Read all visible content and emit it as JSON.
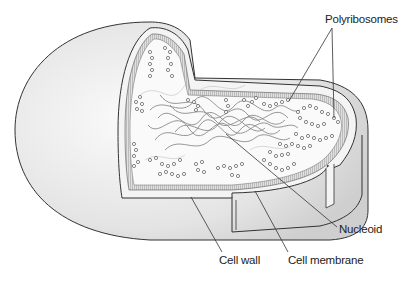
{
  "diagram": {
    "labels": {
      "polyribosomes": "Polyribosomes",
      "nucleoid": "Nucleoid",
      "cell_wall": "Cell wall",
      "cell_membrane": "Cell membrane"
    },
    "colors": {
      "outer_surface": "#e6e6e6",
      "cut_face": "#f7f7f7",
      "cytoplasm": "#fafafa",
      "membrane_hatch": "#9a9a9a",
      "nucleoid_strands": "#8a8a8a",
      "outline": "#333333"
    }
  }
}
